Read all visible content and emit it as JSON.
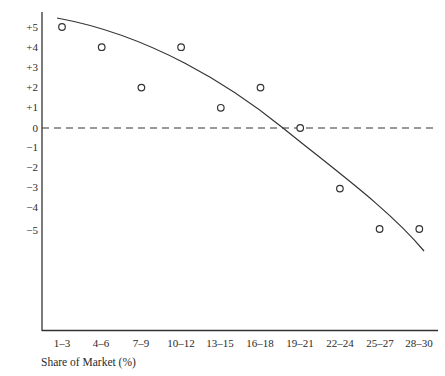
{
  "chart_data": {
    "type": "scatter",
    "title": "",
    "xlabel": "Share of Market (%)",
    "ylabel": "",
    "categories": [
      "1–3",
      "4–6",
      "7–9",
      "10–12",
      "13–15",
      "16–18",
      "19–21",
      "22–24",
      "25–27",
      "28–30"
    ],
    "series": [
      {
        "name": "Observed",
        "marker": "open-circle",
        "values": [
          5,
          4,
          2,
          4,
          1,
          2,
          0,
          -3,
          -5,
          -5
        ]
      },
      {
        "name": "Fitted trend curve",
        "style": "solid-line",
        "shape": "concave-down curve crossing zero near 19–21"
      }
    ],
    "reference_lines": [
      {
        "y": 0,
        "style": "dashed"
      }
    ],
    "yticks": [
      "+5",
      "+4",
      "+3",
      "+2",
      "+1",
      "0",
      "−1",
      "−2",
      "−3",
      "−4",
      "−5"
    ],
    "ylim": [
      -10,
      5.7
    ],
    "grid": false,
    "legend": "none"
  },
  "axis": {
    "y_ticks": [
      "+5",
      "+4",
      "+3",
      "+2",
      "+1",
      "0",
      "−1",
      "−2",
      "−3",
      "−4",
      "−5"
    ],
    "x_ticks": [
      "1–3",
      "4–6",
      "7–9",
      "10–12",
      "13–15",
      "16–18",
      "19–21",
      "22–24",
      "25–27",
      "28–30"
    ],
    "x_title": "Share of Market (%)"
  }
}
